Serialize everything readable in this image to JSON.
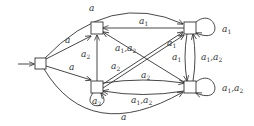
{
  "diagram": {
    "type": "automaton",
    "nodes": [
      {
        "id": "s",
        "initial": true
      },
      {
        "id": "n1"
      },
      {
        "id": "n2"
      },
      {
        "id": "n3"
      },
      {
        "id": "n4"
      }
    ],
    "edges": [
      {
        "from": "s",
        "to": "n3",
        "label": "a"
      },
      {
        "from": "s",
        "to": "n1",
        "label": "a"
      },
      {
        "from": "s",
        "to": "n2",
        "label": "a"
      },
      {
        "from": "s",
        "to": "n4",
        "label": "a"
      },
      {
        "from": "n3",
        "to": "n1",
        "label": "a1"
      },
      {
        "from": "n3",
        "to": "n3",
        "label": "a1"
      },
      {
        "from": "n4",
        "to": "n4",
        "label": "a1,a2"
      },
      {
        "from": "n2",
        "to": "n2",
        "label": "a2"
      },
      {
        "from": "n2",
        "to": "n1",
        "label": "a2"
      },
      {
        "from": "n2",
        "to": "n3",
        "label": "a2"
      },
      {
        "from": "n2",
        "to": "n3",
        "label": "a1"
      },
      {
        "from": "n4",
        "to": "n1",
        "label": "a1,a2"
      },
      {
        "from": "n3",
        "to": "n4",
        "label": "a1"
      },
      {
        "from": "n4",
        "to": "n3",
        "label": "a1,a2"
      },
      {
        "from": "n2",
        "to": "n4",
        "label": "a2"
      },
      {
        "from": "n4",
        "to": "n2",
        "label": "a1,a2"
      }
    ]
  }
}
